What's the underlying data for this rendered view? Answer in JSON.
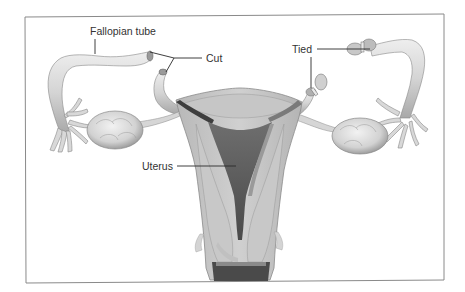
{
  "figure": {
    "labels": {
      "fallopian_tube": "Fallopian tube",
      "cut": "Cut",
      "tied": "Tied",
      "uterus": "Uterus"
    }
  },
  "colors": {
    "background": "#ffffff",
    "frame": "#8a8a8a",
    "tissue_light": "#d9d9d9",
    "tissue_mid": "#bdbdbd",
    "tissue_dark": "#5a5a5a",
    "text": "#333333"
  }
}
